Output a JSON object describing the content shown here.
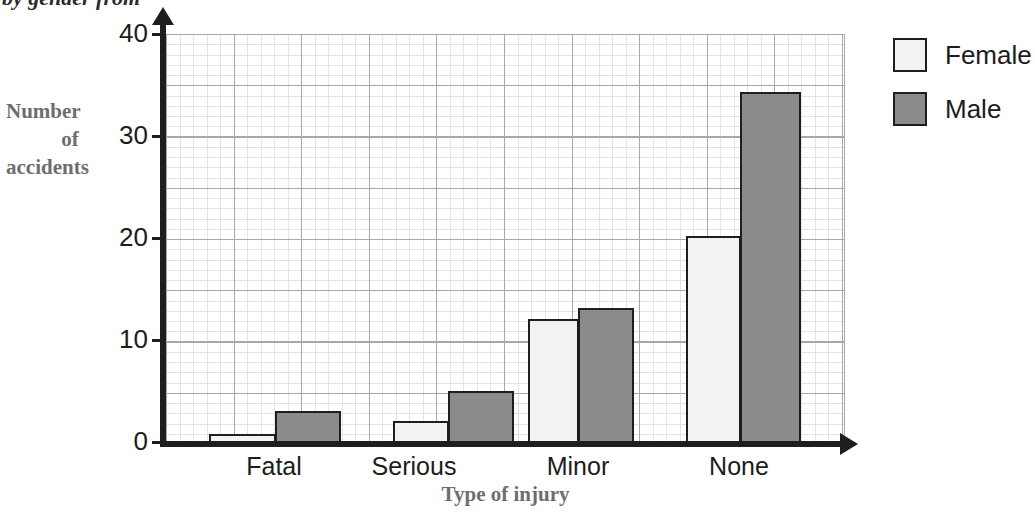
{
  "caption": {
    "text": "by gender from"
  },
  "legend": {
    "position": "right",
    "entries": [
      {
        "label": "Female",
        "color": "#f2f2f2"
      },
      {
        "label": "Male",
        "color": "#8b8b8b"
      }
    ]
  },
  "y_axis": {
    "title_line1": "Number",
    "title_line2": "of",
    "title_line3": "accidents",
    "ticks": [
      "0",
      "10",
      "20",
      "30",
      "40"
    ]
  },
  "x_axis": {
    "title": "Type of injury",
    "categories": [
      "Fatal",
      "Serious",
      "Minor",
      "None"
    ]
  },
  "chart_data": {
    "type": "bar",
    "title": "",
    "xlabel": "Type of injury",
    "ylabel": "Number of accidents",
    "categories": [
      "Fatal",
      "Serious",
      "Minor",
      "None"
    ],
    "series": [
      {
        "name": "Female",
        "color": "#f2f2f2",
        "values": [
          1,
          2.2,
          12.2,
          20.3
        ]
      },
      {
        "name": "Male",
        "color": "#8b8b8b",
        "values": [
          3.2,
          5.2,
          13.3,
          34.3
        ]
      }
    ],
    "ylim": [
      0,
      40
    ],
    "ytick_interval": 10,
    "grid": true,
    "grid_minor_interval": 1,
    "grid_major_interval": 5,
    "legend_position": "right",
    "legend_entries": [
      "Female",
      "Male"
    ]
  },
  "geometry": {
    "y_zero_px": 444,
    "px_per_unit": 10.25,
    "bars": [
      {
        "series": "Female",
        "category": "Fatal",
        "left": 43,
        "width": 67
      },
      {
        "series": "Male",
        "category": "Fatal",
        "left": 109,
        "width": 66
      },
      {
        "series": "Female",
        "category": "Serious",
        "left": 227,
        "width": 56
      },
      {
        "series": "Male",
        "category": "Serious",
        "left": 282,
        "width": 66
      },
      {
        "series": "Female",
        "category": "Minor",
        "left": 362,
        "width": 51
      },
      {
        "series": "Male",
        "category": "Minor",
        "left": 412,
        "width": 56
      },
      {
        "series": "Female",
        "category": "None",
        "left": 520,
        "width": 55
      },
      {
        "series": "Male",
        "category": "None",
        "left": 574,
        "width": 61
      }
    ],
    "tick_tops": [
      441,
      339,
      237,
      135,
      33
    ],
    "cat_label_centers": [
      274,
      414,
      578,
      739
    ]
  }
}
